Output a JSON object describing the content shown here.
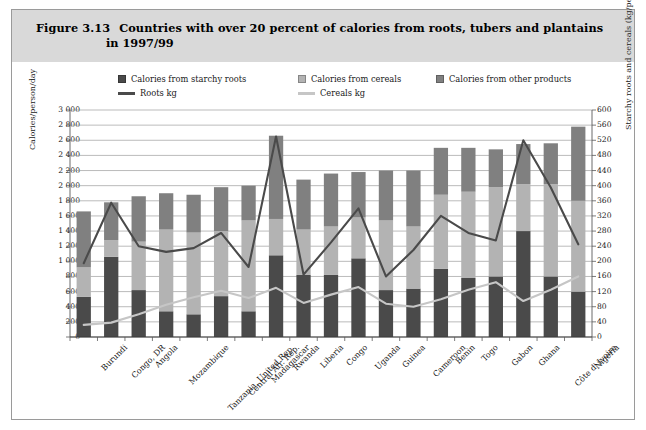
{
  "figure": {
    "number": "Figure 3.13",
    "title_line1": "Countries with over 20 percent of calories from roots, tubers and plantains",
    "title_line2": "in 1997/99"
  },
  "legend": {
    "items": [
      {
        "label": "Calories from starchy roots",
        "type": "swatch",
        "color": "#4a4a4a"
      },
      {
        "label": "Calories from cereals",
        "type": "swatch",
        "color": "#b3b3b3"
      },
      {
        "label": "Calories from other products",
        "type": "swatch",
        "color": "#808080"
      },
      {
        "label": "Roots kg",
        "type": "line",
        "color": "#4a4a4a"
      },
      {
        "label": "Cereals kg",
        "type": "line",
        "color": "#c6c6c6"
      }
    ]
  },
  "axes": {
    "left_title": "Calories/person/day",
    "right_title": "Starchy roots and cereals (kg/person/year)",
    "left_ticks": [
      "3 000",
      "2 800",
      "2 600",
      "2 400",
      "2 200",
      "2 000",
      "1 800",
      "1 600",
      "1 400",
      "1 200",
      "1 000",
      "800",
      "600",
      "400",
      "200",
      "0"
    ],
    "right_ticks": [
      "600",
      "560",
      "520",
      "480",
      "440",
      "400",
      "360",
      "320",
      "280",
      "240",
      "200",
      "160",
      "120",
      "80",
      "40",
      "0"
    ],
    "left_min": 0,
    "left_max": 3000,
    "left_step": 200,
    "right_min": 0,
    "right_max": 600,
    "right_step": 40
  },
  "chart_data": {
    "type": "bar",
    "xlabel": "",
    "ylabel": "Calories/person/day",
    "y2label": "Starchy roots and cereals (kg/person/year)",
    "ylim": [
      0,
      3000
    ],
    "y2lim": [
      0,
      600
    ],
    "grid": true,
    "legend_position": "top",
    "stacked": true,
    "categories": [
      "Burundi",
      "Congo, DR",
      "Angola",
      "Mozambique",
      "Tanzania, United Rep.",
      "Central Afr. Rep.",
      "Madagascar",
      "Rwanda",
      "Liberia",
      "Congo",
      "Uganda",
      "Guinea",
      "Cameroon",
      "Benin",
      "Togo",
      "Gabon",
      "Ghana",
      "Côte d' Ivoire",
      "Nigeria"
    ],
    "series": [
      {
        "name": "Calories from starchy roots",
        "axis": "left",
        "color": "#4a4a4a",
        "values": [
          530,
          1060,
          620,
          340,
          300,
          540,
          340,
          1080,
          820,
          820,
          1040,
          620,
          640,
          900,
          780,
          800,
          1400,
          800,
          600
        ]
      },
      {
        "name": "Calories from cereals",
        "axis": "left",
        "color": "#b3b3b3",
        "values": [
          390,
          220,
          640,
          1080,
          1080,
          860,
          1200,
          480,
          600,
          640,
          540,
          920,
          820,
          980,
          1140,
          1180,
          620,
          1220,
          1200
        ]
      },
      {
        "name": "Calories from other products",
        "axis": "left",
        "color": "#808080",
        "values": [
          740,
          500,
          600,
          480,
          500,
          580,
          460,
          1100,
          660,
          700,
          600,
          660,
          740,
          620,
          580,
          500,
          530,
          540,
          980
        ]
      },
      {
        "name": "Roots kg",
        "axis": "right",
        "type": "line",
        "color": "#4a4a4a",
        "values": [
          195,
          355,
          240,
          225,
          235,
          275,
          185,
          530,
          165,
          250,
          340,
          160,
          230,
          320,
          275,
          255,
          520,
          395,
          245
        ]
      },
      {
        "name": "Cereals kg",
        "axis": "right",
        "type": "line",
        "color": "#c6c6c6",
        "values": [
          32,
          38,
          60,
          85,
          105,
          122,
          103,
          130,
          90,
          112,
          132,
          88,
          80,
          100,
          125,
          145,
          95,
          125,
          160
        ]
      }
    ],
    "bar_totals": [
      1660,
      1780,
      1860,
      1900,
      1880,
      1980,
      2000,
      2660,
      2080,
      2160,
      2180,
      2200,
      2200,
      2500,
      2500,
      2480,
      2550,
      2560,
      2780
    ]
  }
}
